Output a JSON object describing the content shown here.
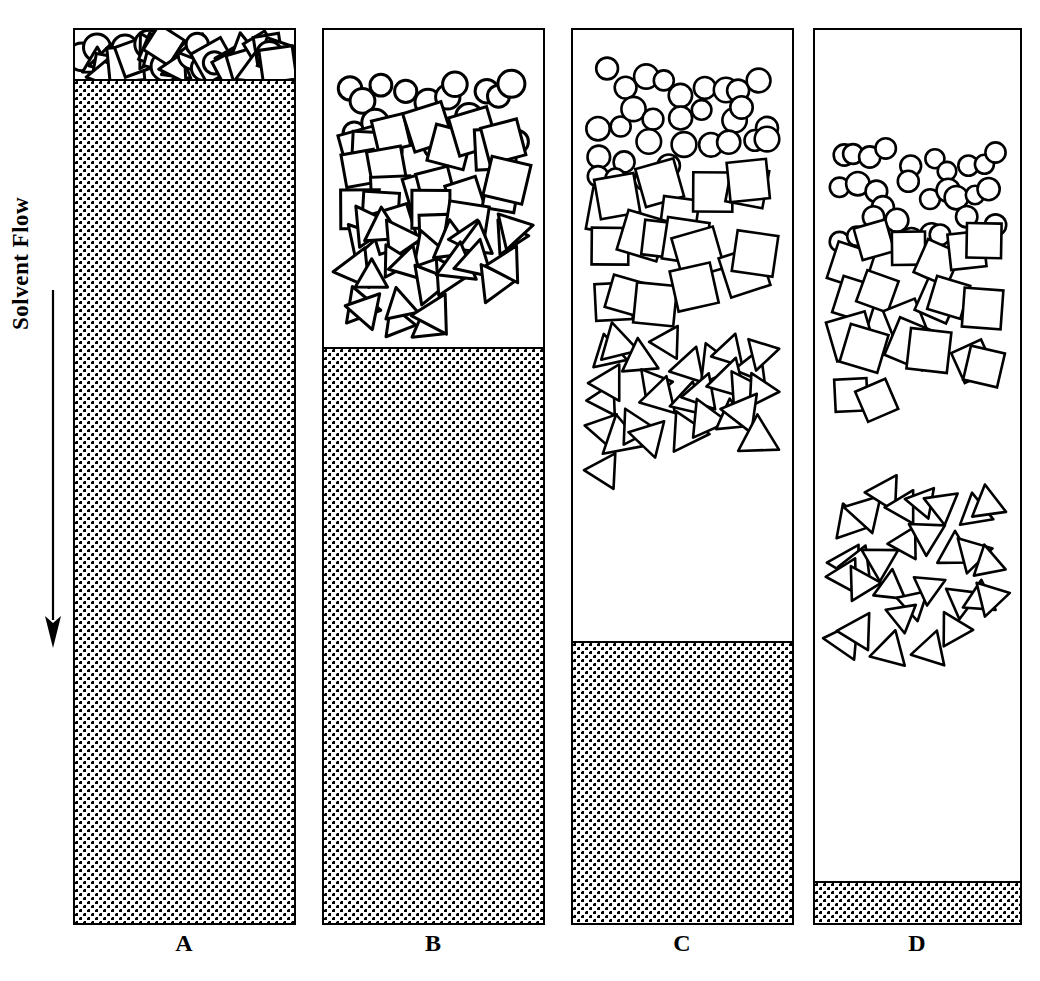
{
  "figure": {
    "flow_label": "Solvent Flow",
    "arrow_direction": "down",
    "shape_types": [
      "circle",
      "square",
      "triangle"
    ],
    "stroke_color": "#000000",
    "fill_color": "#ffffff",
    "stipple_color": "#000000"
  },
  "columns": [
    {
      "id": "A",
      "label": "A",
      "left": 73,
      "top": 28,
      "width": 223,
      "height": 897,
      "stipple_top": 83,
      "stipple_height": 842,
      "mixed_band": {
        "top": 0,
        "height": 53,
        "description": "all shapes overlapped at top of column"
      },
      "bands": [
        {
          "shape": "circle",
          "top": 30,
          "bottom": 80,
          "count": 11
        },
        {
          "shape": "square",
          "top": 30,
          "bottom": 80,
          "count": 13
        },
        {
          "shape": "triangle",
          "top": 30,
          "bottom": 80,
          "count": 12
        }
      ],
      "separation_state": "unseparated"
    },
    {
      "id": "B",
      "label": "B",
      "left": 322,
      "top": 28,
      "width": 223,
      "height": 897,
      "stipple_top": 351,
      "stipple_height": 574,
      "bands": [
        {
          "shape": "circle",
          "top": 38,
          "bottom": 125,
          "count": 20
        },
        {
          "shape": "square",
          "top": 85,
          "bottom": 215,
          "count": 22
        },
        {
          "shape": "triangle",
          "top": 185,
          "bottom": 295,
          "count": 26
        }
      ],
      "separation_state": "partially-separated-overlapping"
    },
    {
      "id": "C",
      "label": "C",
      "left": 571,
      "top": 28,
      "width": 223,
      "height": 897,
      "stipple_top": 645,
      "stipple_height": 280,
      "bands": [
        {
          "shape": "circle",
          "top": 35,
          "bottom": 175,
          "count": 30
        },
        {
          "shape": "square",
          "top": 145,
          "bottom": 300,
          "count": 18
        },
        {
          "shape": "triangle",
          "top": 300,
          "bottom": 445,
          "count": 28
        }
      ],
      "separation_state": "mostly-separated"
    },
    {
      "id": "D",
      "label": "D",
      "left": 813,
      "top": 28,
      "width": 209,
      "height": 897,
      "stipple_top": 885,
      "stipple_height": 40,
      "bands": [
        {
          "shape": "circle",
          "top": 112,
          "bottom": 218,
          "count": 30
        },
        {
          "shape": "square",
          "top": 205,
          "bottom": 390,
          "count": 20
        },
        {
          "shape": "triangle",
          "top": 450,
          "bottom": 620,
          "count": 30
        }
      ],
      "separation_state": "fully-separated"
    }
  ],
  "chart_data": {
    "type": "diagram",
    "stages": [
      "A",
      "B",
      "C",
      "D"
    ],
    "annotations": [
      "Solvent Flow"
    ]
  }
}
